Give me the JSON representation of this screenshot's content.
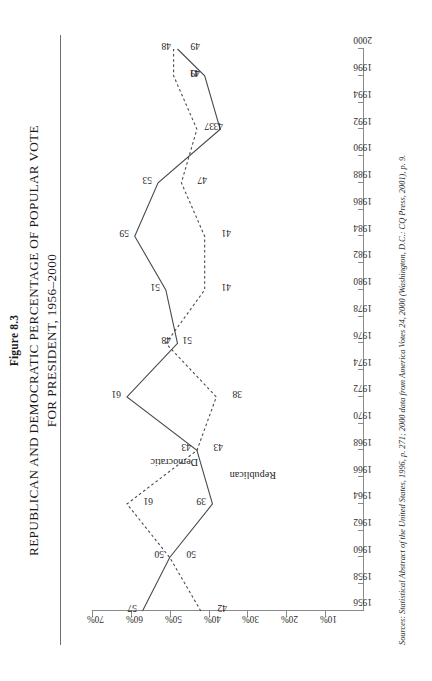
{
  "figure": {
    "number": "Figure 8.3",
    "title_line1": "REPUBLICAN AND DEMOCRATIC PERCENTAGE OF POPULAR VOTE",
    "title_line2": "FOR PRESIDENT, 1956–2000"
  },
  "source_note": "Sources: Statistical Abstract of the United States, 1996, p. 271; 2000 data from America Votes 24, 2000 (Washington, D.C.: CQ Press, 2001), p. 9.",
  "axes": {
    "x_tick_labels": [
      "1956",
      "1958",
      "1960",
      "1962",
      "1964",
      "1966",
      "1968",
      "1970",
      "1972",
      "1974",
      "1976",
      "1978",
      "1980",
      "1982",
      "1984",
      "1986",
      "1988",
      "1990",
      "1992",
      "1994",
      "1996",
      "2000"
    ],
    "y_tick_labels": [
      "10%",
      "20%",
      "30%",
      "40%",
      "50%",
      "60%",
      "70%"
    ]
  },
  "series_labels": {
    "democratic": "Democratic",
    "republican": "Republican"
  },
  "chart_data": {
    "type": "line",
    "title": "REPUBLICAN AND DEMOCRATIC PERCENTAGE OF POPULAR VOTE FOR PRESIDENT, 1956–2000",
    "xlabel": "",
    "ylabel": "",
    "x": [
      1956,
      1960,
      1964,
      1968,
      1972,
      1976,
      1980,
      1984,
      1988,
      1992,
      1996,
      2000
    ],
    "xlim": [
      1956,
      2000
    ],
    "ylim": [
      0,
      70
    ],
    "yticks": [
      10,
      20,
      30,
      40,
      50,
      60,
      70
    ],
    "ytick_labels": [
      "10%",
      "20%",
      "30%",
      "40%",
      "50%",
      "60%",
      "70%"
    ],
    "grid": false,
    "legend": "inline-annotations",
    "series": [
      {
        "name": "Republican",
        "style": "solid",
        "color": "#4a4a4a",
        "values": [
          57,
          50,
          39,
          43,
          61,
          48,
          51,
          59,
          53,
          37,
          41,
          48
        ],
        "point_labels": [
          "57",
          "50",
          "39",
          "43",
          "61",
          "48",
          "51",
          "59",
          "53",
          "37",
          "41",
          "48"
        ]
      },
      {
        "name": "Democratic",
        "style": "dashed",
        "color": "#4a4a4a",
        "values": [
          42,
          50,
          61,
          43,
          38,
          51,
          41,
          41,
          47,
          43,
          49,
          49
        ],
        "point_labels": [
          "42",
          "50",
          "61",
          "43",
          "38",
          "51",
          "41",
          "41",
          "47",
          "43",
          "49",
          "49"
        ]
      }
    ]
  }
}
